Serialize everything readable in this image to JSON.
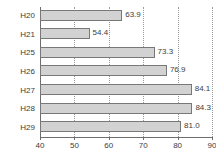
{
  "chart_data": {
    "type": "bar",
    "orientation": "horizontal",
    "title": "",
    "xlabel": "",
    "ylabel": "",
    "categories": [
      "H20",
      "H21",
      "H25",
      "H26",
      "H27",
      "H28",
      "H29"
    ],
    "values": [
      63.9,
      54.4,
      73.3,
      76.9,
      84.1,
      84.3,
      81.0
    ],
    "value_labels": [
      "63.9",
      "54.4",
      "73.3",
      "76.9",
      "84.1",
      "84.3",
      "81.0"
    ],
    "xlim": [
      40,
      90
    ],
    "xticks": [
      40,
      50,
      60,
      70,
      80,
      90
    ],
    "xtick_labels": [
      "40",
      "50",
      "60",
      "70",
      "80",
      "90"
    ],
    "grid": "vertical-dotted",
    "legend": null,
    "series": [
      {
        "name": "",
        "values": [
          63.9,
          54.4,
          73.3,
          76.9,
          84.1,
          84.3,
          81.0
        ]
      }
    ]
  },
  "style": {
    "bar_fill": "#d2d2d2",
    "bar_border": "#787878",
    "axis_color": "#6d6d6d",
    "grid_color": "#9a9a9a",
    "text_color": "#3c3c3c",
    "background": "#ffffff"
  }
}
